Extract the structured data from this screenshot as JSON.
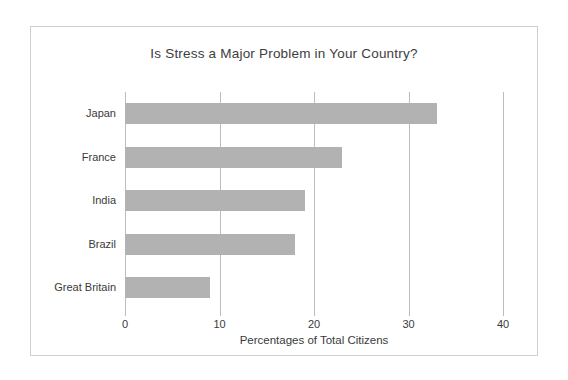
{
  "chart_data": {
    "type": "bar",
    "orientation": "horizontal",
    "title": "Is Stress a Major Problem in Your Country?",
    "categories": [
      "Japan",
      "France",
      "India",
      "Brazil",
      "Great Britain"
    ],
    "values": [
      33,
      23,
      19,
      18,
      9
    ],
    "series": [
      {
        "name": "Percentages of Total Citizens",
        "values": [
          33,
          23,
          19,
          18,
          9
        ]
      }
    ],
    "xlabel": "Percentages of Total Citizens",
    "ylabel": "",
    "xlim": [
      0,
      40
    ],
    "xticks": [
      0,
      10,
      20,
      30,
      40
    ],
    "xtick_labels": [
      "0",
      "10",
      "20",
      "30",
      "40"
    ],
    "grid": "vertical",
    "legend": "none",
    "bar_color": "#b2b2b2",
    "gridline_color": "#bdbdbd",
    "frame_color": "#cfcfcf",
    "background_color": "#ffffff",
    "text_color": "#3a3a3a"
  }
}
